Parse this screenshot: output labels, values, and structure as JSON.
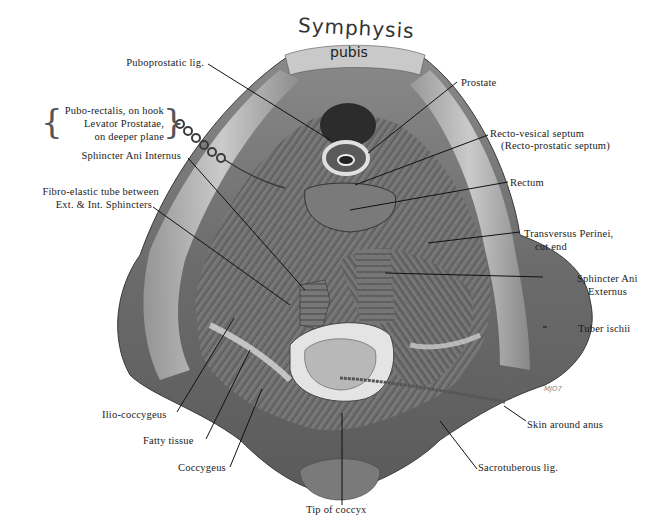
{
  "figure": {
    "title_line1": "Symphysis",
    "title_line2": "pubis",
    "signature": "MJO7",
    "labels": {
      "puboprostatic": "Puboprostatic lig.",
      "puborectalis_1": "Pubo-rectalis, on hook",
      "puborectalis_2": "Levator Prostatae,",
      "puborectalis_3": "on deeper plane",
      "sphincter_internus": "Sphincter Ani Internus",
      "fibro_1": "Fibro-elastic tube between",
      "fibro_2": "Ext. & Int. Sphincters",
      "prostate": "Prostate",
      "rectovesical_1": "Recto-vesical septum",
      "rectovesical_2": "(Recto-prostatic septum)",
      "rectum": "Rectum",
      "transversus_1": "Transversus Perinei,",
      "transversus_2": "cut end",
      "sphincter_externus_1": "Sphincter Ani",
      "sphincter_externus_2": "Externus",
      "tuber": "Tuber ischii",
      "iliococcygeus": "Ilio-coccygeus",
      "fatty": "Fatty tissue",
      "coccygeus": "Coccygeus",
      "tip_coccyx": "Tip of coccyx",
      "skin_anus": "Skin around anus",
      "sacrotuberous": "Sacrotuberous lig."
    }
  }
}
